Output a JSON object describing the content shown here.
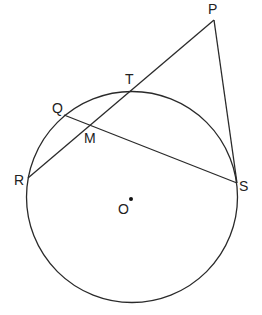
{
  "diagram": {
    "circle": {
      "center_label": "O",
      "cx": 131,
      "cy": 197,
      "r": 106
    },
    "points": [
      {
        "label": "P",
        "x": 214,
        "y": 20,
        "lx": 208,
        "ly": 14
      },
      {
        "label": "T",
        "x": 132,
        "y": 89,
        "lx": 124,
        "ly": 84
      },
      {
        "label": "Q",
        "x": 64,
        "y": 115,
        "lx": 51,
        "ly": 113
      },
      {
        "label": "M",
        "x": 90,
        "y": 125,
        "lx": 84,
        "ly": 143
      },
      {
        "label": "R",
        "x": 28,
        "y": 178,
        "lx": 14,
        "ly": 184
      },
      {
        "label": "S",
        "x": 237,
        "y": 183,
        "lx": 239,
        "ly": 190
      },
      {
        "label": "O",
        "x": 131,
        "y": 199,
        "lx": 118,
        "ly": 213
      }
    ],
    "segments": [
      {
        "from": "P",
        "to": "R"
      },
      {
        "from": "P",
        "to": "S"
      },
      {
        "from": "Q",
        "to": "S"
      }
    ]
  }
}
